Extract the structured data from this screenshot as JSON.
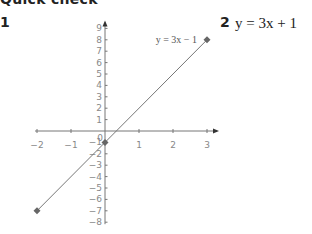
{
  "section_title": "Quick check",
  "questions": [
    {
      "number": "1",
      "type": "graph"
    },
    {
      "number": "2",
      "answer": "y = 3x + 1"
    }
  ],
  "chart_data": {
    "type": "line",
    "title": "",
    "xlabel": "",
    "ylabel": "",
    "xlim": [
      -2,
      3
    ],
    "ylim": [
      -8,
      9
    ],
    "x_ticks": [
      -2,
      -1,
      0,
      1,
      2,
      3
    ],
    "y_ticks": [
      -8,
      -7,
      -6,
      -5,
      -4,
      -3,
      -2,
      -1,
      0,
      1,
      2,
      3,
      4,
      5,
      6,
      7,
      8,
      9
    ],
    "grid": false,
    "series": [
      {
        "name": "y = 3x − 1",
        "x": [
          -2,
          0,
          3
        ],
        "y": [
          -7,
          -1,
          8
        ],
        "markers": true
      }
    ],
    "annotations": [
      {
        "text": "y = 3x − 1",
        "x": 3,
        "y": 8
      }
    ],
    "line_color": "#777777",
    "marker_color": "#666666"
  }
}
